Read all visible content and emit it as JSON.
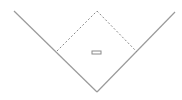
{
  "diagram": {
    "type": "baseball-field",
    "colors": {
      "background": "#ffffff",
      "foul_line": "#9a9a9a",
      "base_path": "#8a8a8a",
      "rubber": "#8a8a8a"
    },
    "foul_lines": {
      "home_plate": [
        97,
        92
      ],
      "left_end": [
        14,
        11
      ],
      "right_end": [
        175,
        12
      ]
    },
    "infield": {
      "home": [
        97,
        92
      ],
      "first_base": [
        137,
        52
      ],
      "second_base": [
        97,
        11
      ],
      "third_base": [
        57,
        51
      ]
    },
    "pitchers_rubber": {
      "x": 92,
      "y": 51,
      "width": 9,
      "height": 3
    }
  }
}
